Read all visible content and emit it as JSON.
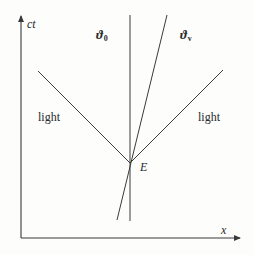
{
  "diagram": {
    "type": "spacetime-diagram",
    "axes": {
      "vertical_label": "ct",
      "horizontal_label": "x"
    },
    "worldlines": [
      {
        "symbol": "ϑ",
        "subscript": "0",
        "description": "vertical worldline (at rest)"
      },
      {
        "symbol": "ϑ",
        "subscript": "v",
        "description": "tilted worldline (moving with velocity v)"
      }
    ],
    "light_labels": {
      "left": "light",
      "right": "light"
    },
    "event_label": "E",
    "colors": {
      "line": "#3a3a3a",
      "text": "#2a2a2a",
      "background": "#fdfdfc"
    }
  }
}
